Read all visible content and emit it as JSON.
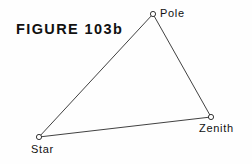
{
  "figure": {
    "title": "FIGURE 103b",
    "background_color": "#fefefe",
    "line_color": "#2b2b2b",
    "text_color": "#111111"
  },
  "diagram": {
    "type": "triangle",
    "vertices": [
      {
        "id": "pole",
        "label": "Pole",
        "x": 153,
        "y": 14,
        "marker": "open-circle",
        "label_x": 160,
        "label_y": 8
      },
      {
        "id": "zenith",
        "label": "Zenith",
        "x": 211,
        "y": 117,
        "marker": "open-circle",
        "label_x": 199,
        "label_y": 123
      },
      {
        "id": "star",
        "label": "Star",
        "x": 39,
        "y": 137,
        "marker": "open-circle",
        "label_x": 31,
        "label_y": 144
      }
    ],
    "edges": [
      {
        "id": "star-pole",
        "from": "star",
        "to": "pole"
      },
      {
        "id": "pole-zenith",
        "from": "pole",
        "to": "zenith"
      },
      {
        "id": "star-zenith",
        "from": "star",
        "to": "zenith"
      }
    ]
  },
  "title_position": {
    "x": 16,
    "y": 22
  }
}
